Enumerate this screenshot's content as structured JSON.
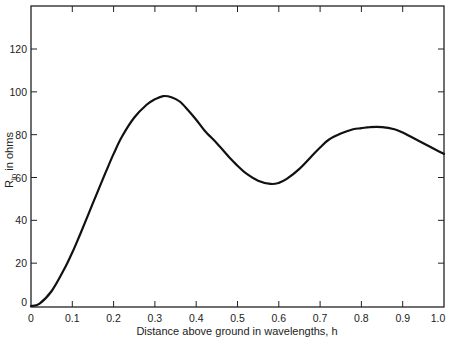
{
  "chart_data": {
    "type": "line",
    "title": "",
    "xlabel": "Distance above ground in wavelengths, h",
    "ylabel": "R_in in ohms",
    "ylabel_main": "R",
    "ylabel_sub": "in",
    "ylabel_rest": " in ohms",
    "xlim": [
      0,
      1.0
    ],
    "ylim": [
      0,
      140
    ],
    "x_ticks": [
      "0",
      "0.1",
      "0.2",
      "0.3",
      "0.4",
      "0.5",
      "0.6",
      "0.7",
      "0.8",
      "0.9",
      "1.0"
    ],
    "y_ticks": [
      "0",
      "20",
      "40",
      "60",
      "80",
      "100",
      "120"
    ],
    "grid": false,
    "legend": null,
    "series": [
      {
        "name": "R_in",
        "x": [
          0,
          0.02,
          0.05,
          0.08,
          0.1,
          0.12,
          0.15,
          0.18,
          0.2,
          0.22,
          0.25,
          0.28,
          0.3,
          0.32,
          0.34,
          0.36,
          0.38,
          0.4,
          0.42,
          0.45,
          0.48,
          0.5,
          0.52,
          0.55,
          0.58,
          0.6,
          0.62,
          0.65,
          0.68,
          0.7,
          0.72,
          0.75,
          0.78,
          0.8,
          0.82,
          0.85,
          0.88,
          0.9,
          0.92,
          0.95,
          0.98,
          1.0
        ],
        "values": [
          0,
          1,
          7,
          17,
          25,
          34,
          48,
          62,
          71,
          79,
          88,
          94,
          96.5,
          98,
          97.5,
          95.5,
          91.5,
          87,
          82,
          76,
          69.5,
          65.5,
          62,
          58.5,
          57,
          57.5,
          59.5,
          64,
          70,
          74,
          77.5,
          80.5,
          82.5,
          83,
          83.5,
          83.5,
          82.5,
          81,
          79,
          76,
          73,
          71
        ]
      }
    ]
  }
}
